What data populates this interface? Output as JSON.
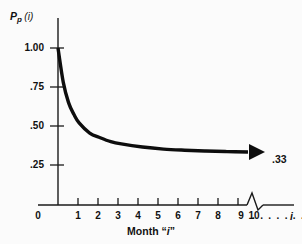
{
  "chart_data": {
    "type": "line",
    "title": "",
    "subtitle": "",
    "xlabel": "Month “i”",
    "ylabel": "Pp (i)",
    "ylabel_parts": {
      "base": "P",
      "subscript": "p",
      "arg": "(i)"
    },
    "xlim": [
      0,
      11
    ],
    "ylim": [
      0,
      1.125
    ],
    "grid": false,
    "legend": null,
    "x_tick_labels": [
      "0",
      "1",
      "2",
      "3",
      "4",
      "5",
      "6",
      "7",
      "8",
      "9",
      "10"
    ],
    "x_tick_values": [
      0,
      1,
      2,
      3,
      4,
      5,
      6,
      7,
      8,
      9,
      10
    ],
    "x_axis_break": true,
    "x_axis_continuation": ". . . . . . . . .",
    "x_axis_variable": "i",
    "y_tick_labels": [
      "1.00",
      ".75",
      ".50",
      ".25"
    ],
    "y_tick_values": [
      1.0,
      0.75,
      0.5,
      0.25
    ],
    "series": [
      {
        "name": "Pp(i)",
        "color": "#0d0d0d",
        "x": [
          1,
          1.25,
          1.5,
          1.75,
          2,
          2.5,
          3,
          3.5,
          4,
          5,
          6,
          7,
          8,
          9,
          10
        ],
        "values": [
          1.0,
          0.78,
          0.65,
          0.575,
          0.52,
          0.455,
          0.425,
          0.4,
          0.385,
          0.365,
          0.352,
          0.345,
          0.34,
          0.336,
          0.333
        ]
      }
    ],
    "annotations": [
      {
        "name": "asymptote-value",
        "text": ".33",
        "x": 10.5,
        "y": 0.33,
        "marker": "arrowhead-right"
      }
    ]
  },
  "colors": {
    "background": "#fbfbfb",
    "axis": "#1a1a1a",
    "curve": "#0d0d0d",
    "text": "#111111"
  }
}
